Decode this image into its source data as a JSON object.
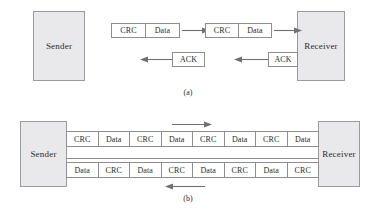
{
  "figure": {
    "panels": [
      {
        "id": "a",
        "caption": "(a)",
        "sender_label": "Sender",
        "receiver_label": "Receiver",
        "forward_frames": [
          {
            "cells": [
              "CRC",
              "Data"
            ]
          },
          {
            "cells": [
              "CRC",
              "Data"
            ]
          }
        ],
        "ack_frames": [
          {
            "cells": [
              "ACK"
            ]
          },
          {
            "cells": [
              "ACK"
            ]
          }
        ],
        "forward_arrow_direction": "right",
        "ack_arrow_direction": "left"
      },
      {
        "id": "b",
        "caption": "(b)",
        "sender_label": "Sender",
        "receiver_label": "Receiver",
        "top_row": {
          "cells": [
            "CRC",
            "Data",
            "CRC",
            "Data",
            "CRC",
            "Data",
            "CRC",
            "Data"
          ],
          "arrow_direction": "right"
        },
        "bottom_row": {
          "cells": [
            "Data",
            "CRC",
            "Data",
            "CRC",
            "Data",
            "CRC",
            "Data",
            "CRC"
          ],
          "arrow_direction": "left"
        }
      }
    ]
  },
  "colors": {
    "node_fill": "#e9e9eb",
    "node_border": "#9b9b9f",
    "frame_fill": "#ffffff",
    "frame_border": "#8d8d92",
    "line": "#6f6f74",
    "text": "#2b2b2b",
    "background": "#ffffff"
  }
}
